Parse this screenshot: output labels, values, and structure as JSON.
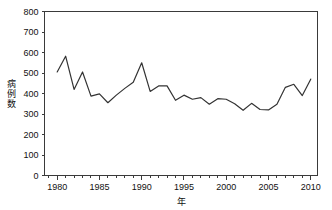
{
  "chart_data": {
    "type": "line",
    "title": "",
    "subtitle": "",
    "xlabel": "年",
    "ylabel": "病例数",
    "xlim": [
      1978.5,
      2010.8
    ],
    "ylim": [
      0,
      800
    ],
    "grid": false,
    "legend": null,
    "legend_position": "none",
    "line_color": "#333333",
    "x_major_ticks": [
      1980,
      1985,
      1990,
      1995,
      2000,
      2005,
      2010
    ],
    "x_major_tick_labels": [
      "1980",
      "1985",
      "1990",
      "1995",
      "2000",
      "2005",
      "2010"
    ],
    "x_minor_tick_step": 1,
    "y_ticks": [
      0,
      100,
      200,
      300,
      400,
      500,
      600,
      700,
      800
    ],
    "y_tick_labels": [
      "0",
      "100",
      "200",
      "300",
      "400",
      "500",
      "600",
      "700",
      "800"
    ],
    "x": [
      1980,
      1981,
      1982,
      1983,
      1984,
      1985,
      1986,
      1987,
      1988,
      1989,
      1990,
      1991,
      1992,
      1993,
      1994,
      1995,
      1996,
      1997,
      1998,
      1999,
      2000,
      2001,
      2002,
      2003,
      2004,
      2005,
      2006,
      2007,
      2008,
      2009,
      2010
    ],
    "values": [
      505,
      582,
      420,
      505,
      387,
      398,
      355,
      392,
      425,
      455,
      550,
      410,
      437,
      437,
      367,
      392,
      372,
      380,
      348,
      375,
      372,
      350,
      318,
      352,
      322,
      320,
      348,
      430,
      445,
      390,
      470
    ],
    "series": [
      {
        "name": "病例数",
        "values": [
          505,
          582,
          420,
          505,
          387,
          398,
          355,
          392,
          425,
          455,
          550,
          410,
          437,
          437,
          367,
          392,
          372,
          380,
          348,
          375,
          372,
          350,
          318,
          352,
          322,
          320,
          348,
          430,
          445,
          390,
          470
        ]
      }
    ]
  }
}
